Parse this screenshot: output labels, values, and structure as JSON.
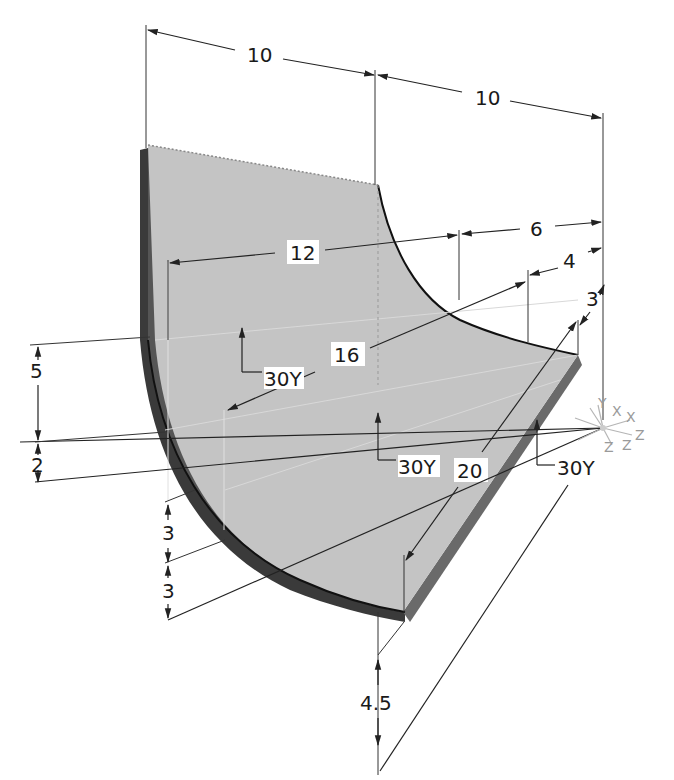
{
  "figure": {
    "type": "3D isometric CAD part with dimensions",
    "colors": {
      "surface": "#c4c4c4",
      "shadow_side": "#3a3a3a",
      "edge_side": "#6a6a6a",
      "lines": "#222222",
      "axis_triad": "#a8a8a8"
    }
  },
  "dimensions": {
    "top_left": "10",
    "top_right": "10",
    "upper_12": "12",
    "upper_6": "6",
    "upper_4": "4",
    "upper_3": "3",
    "mid_16": "16",
    "mid_20": "20",
    "left_5": "5",
    "left_2": "2",
    "lower_3a": "3",
    "lower_3b": "3",
    "bottom_4_5": "4.5"
  },
  "angle_callouts": {
    "left": "30Y",
    "center": "30Y",
    "right": "30Y"
  },
  "axis_triad": {
    "labels": [
      "X",
      "X",
      "Z",
      "Z",
      "Z",
      "Y"
    ]
  }
}
